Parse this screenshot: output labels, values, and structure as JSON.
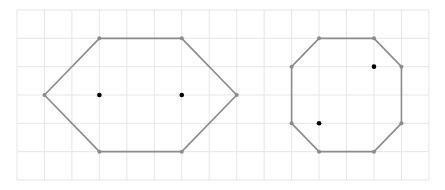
{
  "grid": {
    "x0": 17,
    "y0": 10,
    "cols": 15,
    "rows": 6,
    "cell_w": 27.46,
    "cell_h": 28.33,
    "line_color": "#e6e6e6"
  },
  "colors": {
    "edge": "#8c8c8c",
    "vertex": "#8c8c8c",
    "point": "#000000"
  },
  "shapes": [
    {
      "name": "hexagon",
      "vertices_grid": [
        [
          1,
          3
        ],
        [
          3,
          1
        ],
        [
          6,
          1
        ],
        [
          8,
          3
        ],
        [
          6,
          5
        ],
        [
          3,
          5
        ]
      ],
      "points_grid": [
        [
          3,
          3
        ],
        [
          6,
          3
        ]
      ]
    },
    {
      "name": "octagon",
      "vertices_grid": [
        [
          11,
          1
        ],
        [
          13,
          1
        ],
        [
          14,
          2
        ],
        [
          14,
          4
        ],
        [
          13,
          5
        ],
        [
          11,
          5
        ],
        [
          10,
          4
        ],
        [
          10,
          2
        ]
      ],
      "points_grid": [
        [
          13,
          2
        ],
        [
          11,
          4
        ]
      ]
    }
  ]
}
